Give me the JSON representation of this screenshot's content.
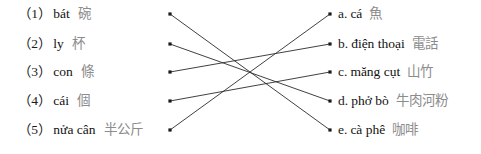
{
  "exercise": {
    "type": "matching",
    "left_items": [
      {
        "number": "（1）",
        "vietnamese": "bát",
        "chinese": "碗",
        "node_id": "L1"
      },
      {
        "number": "（2）",
        "vietnamese": "ly",
        "chinese": "杯",
        "node_id": "L2"
      },
      {
        "number": "（3）",
        "vietnamese": "con",
        "chinese": "條",
        "node_id": "L3"
      },
      {
        "number": "（4）",
        "vietnamese": "cái",
        "chinese": "個",
        "node_id": "L4"
      },
      {
        "number": "（5）",
        "vietnamese": "nửa cân",
        "chinese": "半公斤",
        "node_id": "L5"
      }
    ],
    "right_items": [
      {
        "letter": "a.",
        "vietnamese": "cá",
        "chinese": "魚",
        "node_id": "R1"
      },
      {
        "letter": "b.",
        "vietnamese": "điện thoại",
        "chinese": "電話",
        "node_id": "R2"
      },
      {
        "letter": "c.",
        "vietnamese": "măng cụt",
        "chinese": "山竹",
        "node_id": "R3"
      },
      {
        "letter": "d.",
        "vietnamese": "phở bò",
        "chinese": "牛肉河粉",
        "node_id": "R4"
      },
      {
        "letter": "e.",
        "vietnamese": "cà phê",
        "chinese": "咖啡",
        "node_id": "R5"
      }
    ],
    "connections": [
      {
        "from": "L1",
        "to": "R5"
      },
      {
        "from": "L2",
        "to": "R4"
      },
      {
        "from": "L3",
        "to": "R2"
      },
      {
        "from": "L4",
        "to": "R3"
      },
      {
        "from": "L5",
        "to": "R1"
      }
    ],
    "geometry": {
      "left_node_x": 170,
      "right_node_x": 330,
      "row_y": [
        14,
        44,
        72,
        101,
        130
      ],
      "left_text_x": 18,
      "right_text_x": 338
    },
    "colors": {
      "text": "#111111",
      "gloss": "#8c8c8c",
      "line": "#2b2b2b",
      "background": "#ffffff"
    }
  }
}
